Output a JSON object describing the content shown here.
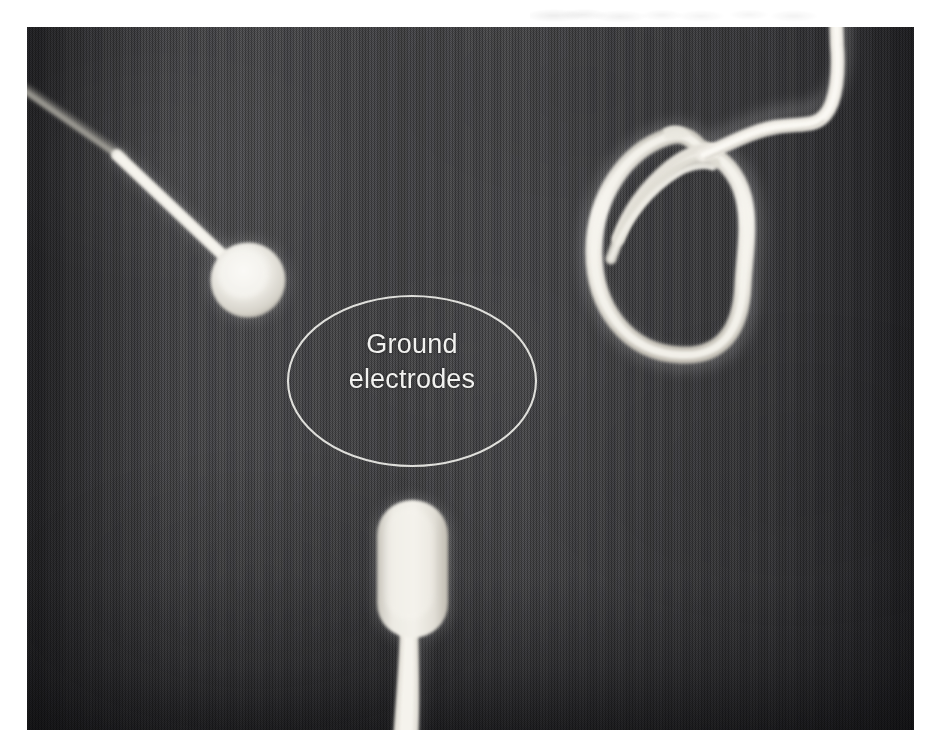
{
  "figure": {
    "kind": "radiograph-photograph",
    "background_color": "#ffffff",
    "plate_color": "#3b3b3c",
    "radiopaque_color": "#f3f2ee"
  },
  "annotation": {
    "label": "Ground\nelectrodes",
    "label_line_1": "Ground",
    "label_line_2": "electrodes",
    "shape": "ellipse-outline",
    "stroke_color": "#e8e8e4",
    "text_color": "#f2f2f0"
  },
  "objects": [
    {
      "name": "disc-ground-electrode",
      "position": "upper-left",
      "shape": "circular disc with lead wire",
      "lead_direction": "exits upper-left edge"
    },
    {
      "name": "coiled-cable",
      "position": "upper-right",
      "shape": "looped coil of cable with wavy tail",
      "lead_direction": "exits top edge"
    },
    {
      "name": "pad-ground-electrode",
      "position": "bottom-center",
      "shape": "rounded rectangular pad with tapering lead",
      "lead_direction": "exits bottom edge"
    }
  ]
}
